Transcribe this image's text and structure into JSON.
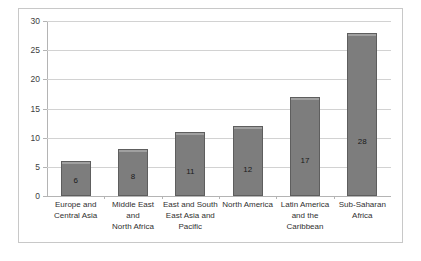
{
  "chart_data": {
    "type": "bar",
    "title": "",
    "xlabel": "",
    "ylabel": "",
    "ylim": [
      0,
      30
    ],
    "ytick_step": 5,
    "yticks": [
      0,
      5,
      10,
      15,
      20,
      25,
      30
    ],
    "ytick_labels": [
      "0",
      "5",
      "10",
      "15",
      "20",
      "25",
      "30"
    ],
    "grid": true,
    "legend": false,
    "legend_position": "none",
    "bar_color": "#7d7d7d",
    "bar_border_color": "#5e5e5e",
    "gridline_color": "#d2d2d2",
    "axis_color": "#b4b4b4",
    "frame_border_color": "#c8c8c8",
    "data_labels_inside": true,
    "categories": [
      "Europe and Central Asia",
      "Middle East and North Africa",
      "East and South East Asia and Pacific",
      "North America",
      "Latin America and the Caribbean",
      "Sub-Saharan Africa"
    ],
    "category_label_lines": [
      [
        "Europe and",
        "Central Asia"
      ],
      [
        "Middle East and",
        "North Africa"
      ],
      [
        "East and South",
        "East Asia and",
        "Pacific"
      ],
      [
        "North America"
      ],
      [
        "Latin America",
        "and the",
        "Caribbean"
      ],
      [
        "Sub-Saharan",
        "Africa"
      ]
    ],
    "values": [
      6,
      8,
      11,
      12,
      17,
      28
    ],
    "value_labels": [
      "6",
      "8",
      "11",
      "12",
      "17",
      "28"
    ]
  }
}
